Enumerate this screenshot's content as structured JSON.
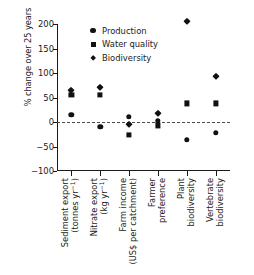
{
  "chart_data": {
    "type": "scatter",
    "title": "",
    "xlabel": "",
    "ylabel": "% change over 25 years",
    "ylim": [
      -100,
      200
    ],
    "yticks": [
      200,
      150,
      100,
      50,
      0,
      -50,
      -100
    ],
    "ytick_labels": [
      "200",
      "150",
      "100",
      "50",
      "0",
      "−50",
      "−100"
    ],
    "grid": false,
    "zero_reference_line": true,
    "legend_position": "top-center",
    "categories": [
      "Sediment export (tonnes yr⁻¹)",
      "Nitrate export (kg yr⁻¹)",
      "Farm income (US$ per catchment)",
      "Farmer preference",
      "Plant biodiversity",
      "Vertebrate biodiversity"
    ],
    "category_label_lines": [
      [
        "Sediment export",
        "(tonnes yr⁻¹)"
      ],
      [
        "Nitrate export",
        "(kg yr⁻¹)"
      ],
      [
        "Farm income",
        "(US$ per catchment)"
      ],
      [
        "Farmer",
        "preference"
      ],
      [
        "Plant",
        "biodiversity"
      ],
      [
        "Vertebrate",
        "biodiversity"
      ]
    ],
    "series": [
      {
        "name": "Production",
        "marker": "circle",
        "values": [
          15,
          -10,
          10,
          2,
          -36,
          -22
        ]
      },
      {
        "name": "Water quality",
        "marker": "square",
        "values": [
          55,
          55,
          -26,
          -7,
          38,
          38
        ]
      },
      {
        "name": "Biodiversity",
        "marker": "diamond",
        "values": [
          66,
          72,
          -5,
          18,
          207,
          94
        ]
      }
    ],
    "marker_color": "#111111"
  },
  "legend": {
    "items": [
      {
        "label": "Production",
        "marker": "circle"
      },
      {
        "label": "Water quality",
        "marker": "square"
      },
      {
        "label": "Biodiversity",
        "marker": "diamond"
      }
    ]
  }
}
